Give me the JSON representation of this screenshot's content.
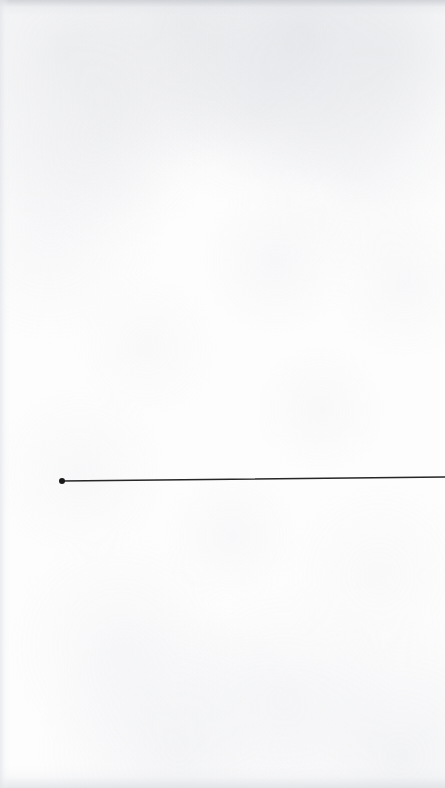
{
  "page": {
    "title": "",
    "width": 445,
    "height": 788,
    "background_color": "#fdfdfd",
    "medium": "scanned-paper",
    "visible_text": []
  },
  "figure": {
    "name": "single-line-plot",
    "stroke_color": "#262626",
    "stroke_width": 1.6,
    "marker_color": "#1a1a1a",
    "marker_radius": 3.0
  },
  "chart_data": {
    "type": "line",
    "title": "",
    "subtitle": "",
    "xlabel": "",
    "ylabel": "",
    "grid": false,
    "legend": null,
    "axes_visible": false,
    "tick_labels_x": [],
    "tick_labels_y": [],
    "xlim": [
      0,
      445
    ],
    "ylim": [
      788,
      0
    ],
    "series": [
      {
        "name": "line-1",
        "color": "#262626",
        "marker": "filled-circle",
        "marker_at": "start",
        "x": [
          62,
          445
        ],
        "y": [
          481,
          477
        ]
      }
    ],
    "annotations": []
  },
  "artifacts": {
    "edge_shadow_top": true,
    "edge_shadow_bottom": true,
    "edge_shadow_left": true,
    "paper_texture": true
  }
}
